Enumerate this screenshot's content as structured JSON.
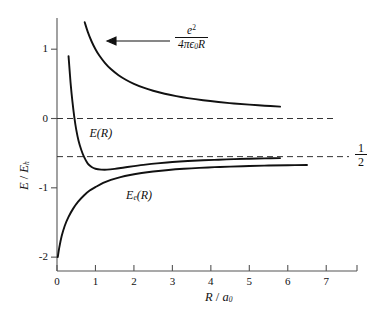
{
  "chart_data": {
    "type": "line",
    "title": "",
    "xlabel": "R / a0",
    "ylabel": "E / Eh",
    "xlim": [
      0,
      7.8
    ],
    "ylim": [
      -2.2,
      1.45
    ],
    "grid": false,
    "legend_position": "inline-annotations",
    "xticks": [
      0,
      1,
      2,
      3,
      4,
      5,
      6,
      7
    ],
    "xtick_labels": [
      "0",
      "1",
      "2",
      "3",
      "4",
      "5",
      "6",
      "7"
    ],
    "yticks": [
      1,
      0,
      -1,
      -2
    ],
    "ytick_labels": [
      "1",
      "0",
      "-1",
      "-2"
    ],
    "reference_lines": [
      {
        "name": "zero-line",
        "y": 0,
        "style": "dashed",
        "label": ""
      },
      {
        "name": "half-asymptote-line",
        "y": -0.55,
        "style": "dashed",
        "label": "1/2"
      }
    ],
    "annotations": [
      {
        "name": "coulomb-formula",
        "numerator": "e2",
        "denominator": "4πϵ0R",
        "x": 2.6,
        "y": 1.0,
        "arrow_to": {
          "x": 1.05,
          "y": 0.93
        }
      },
      {
        "name": "curve-label-E",
        "text": "E(R)",
        "x": 0.95,
        "y": -0.22
      },
      {
        "name": "curve-label-Ee",
        "text": "Ee(R)",
        "x": 1.9,
        "y": -1.12
      }
    ],
    "series": [
      {
        "name": "coulomb-repulsion",
        "label": "e2/(4πϵ0R)",
        "x": [
          0.72,
          0.8,
          0.9,
          1.0,
          1.1,
          1.25,
          1.4,
          1.6,
          1.8,
          2.0,
          2.25,
          2.5,
          2.8,
          3.1,
          3.4,
          3.8,
          4.2,
          4.6,
          5.0,
          5.4,
          5.8
        ],
        "y": [
          1.389,
          1.25,
          1.111,
          1.0,
          0.909,
          0.8,
          0.714,
          0.625,
          0.556,
          0.5,
          0.444,
          0.4,
          0.357,
          0.323,
          0.294,
          0.263,
          0.238,
          0.217,
          0.2,
          0.185,
          0.172
        ]
      },
      {
        "name": "total-energy-E",
        "label": "E(R)",
        "x": [
          0.3,
          0.33,
          0.36,
          0.4,
          0.45,
          0.5,
          0.56,
          0.63,
          0.7,
          0.8,
          0.9,
          1.0,
          1.15,
          1.3,
          1.5,
          1.75,
          2.0,
          2.3,
          2.6,
          3.0,
          3.4,
          3.8,
          4.2,
          4.6,
          5.0,
          5.4,
          5.8
        ],
        "y": [
          0.9,
          0.68,
          0.47,
          0.25,
          0.02,
          -0.16,
          -0.32,
          -0.45,
          -0.55,
          -0.65,
          -0.7,
          -0.725,
          -0.737,
          -0.738,
          -0.727,
          -0.707,
          -0.687,
          -0.665,
          -0.647,
          -0.628,
          -0.613,
          -0.602,
          -0.594,
          -0.586,
          -0.58,
          -0.575,
          -0.571
        ]
      },
      {
        "name": "electronic-energy-Ee",
        "label": "Ee(R)",
        "x": [
          0.02,
          0.06,
          0.12,
          0.2,
          0.3,
          0.42,
          0.55,
          0.7,
          0.85,
          1.0,
          1.2,
          1.4,
          1.65,
          1.9,
          2.2,
          2.5,
          2.9,
          3.3,
          3.7,
          4.1,
          4.5,
          5.0,
          5.5,
          6.0,
          6.5
        ],
        "y": [
          -2.0,
          -1.86,
          -1.7,
          -1.55,
          -1.42,
          -1.3,
          -1.2,
          -1.11,
          -1.04,
          -0.99,
          -0.93,
          -0.885,
          -0.845,
          -0.815,
          -0.787,
          -0.765,
          -0.742,
          -0.725,
          -0.712,
          -0.702,
          -0.694,
          -0.685,
          -0.679,
          -0.674,
          -0.67
        ]
      }
    ]
  },
  "axes": {
    "y_title_parts": {
      "main": "E",
      "slash": " / ",
      "denom": "E",
      "denom_sub": "h"
    },
    "x_title_parts": {
      "main": "R",
      "slash": " / ",
      "denom": "a",
      "denom_sub": "0"
    }
  },
  "labels": {
    "ytick_1": "1",
    "ytick_0": "0",
    "ytick_neg1": "-1",
    "ytick_neg2": "-2",
    "xtick_0": "0",
    "xtick_1": "1",
    "xtick_2": "2",
    "xtick_3": "3",
    "xtick_4": "4",
    "xtick_5": "5",
    "xtick_6": "6",
    "xtick_7": "7",
    "curve_E": "E(R)",
    "curve_Ee_main": "E",
    "curve_Ee_sub": "e",
    "curve_Ee_tail": "(R)",
    "coulomb_num_base": "e",
    "coulomb_num_sup": "2",
    "coulomb_den_pre": "4πϵ",
    "coulomb_den_sub": "0",
    "coulomb_den_post": "R",
    "half_num": "1",
    "half_den": "2"
  },
  "colors": {
    "curve": "#111111",
    "axis": "#555555",
    "dashed": "#333333",
    "background": "#ffffff"
  }
}
